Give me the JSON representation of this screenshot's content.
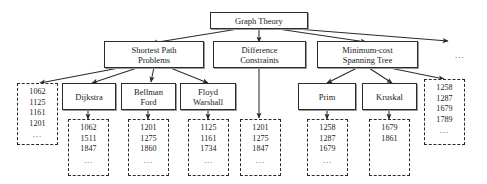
{
  "diagram": {
    "type": "hierarchy-tree",
    "title_node": "Graph Theory",
    "ellipsis": "...",
    "nodes": {
      "root": {
        "lines": [
          "Graph Theory"
        ]
      },
      "shortest_path": {
        "lines": [
          "Shortest Path",
          "Problems"
        ]
      },
      "difference_constraints": {
        "lines": [
          "Difference",
          "Constraints"
        ]
      },
      "mst": {
        "lines": [
          "Minimum-cost",
          "Spanning Tree"
        ]
      },
      "top_more": {
        "label": "..."
      },
      "dijkstra": {
        "lines": [
          "Dijkstra"
        ]
      },
      "bellman_ford": {
        "lines": [
          "Bellman",
          "Ford"
        ]
      },
      "floyd_warshall": {
        "lines": [
          "Floyd",
          "Warshall"
        ]
      },
      "prim": {
        "lines": [
          "Prim"
        ]
      },
      "kruskal": {
        "lines": [
          "Kruskal"
        ]
      }
    },
    "lists": {
      "shortest_path_list": {
        "values": [
          "1062",
          "1125",
          "1161",
          "1201"
        ],
        "more": "..."
      },
      "dijkstra_list": {
        "values": [
          "1062",
          "1511",
          "1847"
        ],
        "more": "..."
      },
      "bellman_ford_list": {
        "values": [
          "1201",
          "1275",
          "1860"
        ],
        "more": "..."
      },
      "floyd_warshall_list": {
        "values": [
          "1125",
          "1161",
          "1734"
        ],
        "more": "..."
      },
      "difference_constraints_list": {
        "values": [
          "1201",
          "1275",
          "1847"
        ],
        "more": "..."
      },
      "prim_list": {
        "values": [
          "1258",
          "1287",
          "1679"
        ],
        "more": "..."
      },
      "kruskal_list": {
        "values": [
          "1679",
          "1861"
        ],
        "more": ""
      },
      "mst_list": {
        "values": [
          "1258",
          "1287",
          "1679",
          "1789"
        ],
        "more": "..."
      }
    },
    "colors": {
      "stroke": "#2b2b2b",
      "shadow": "#9a9a9a",
      "background": "#ffffff",
      "text": "#1a1a1a"
    }
  }
}
